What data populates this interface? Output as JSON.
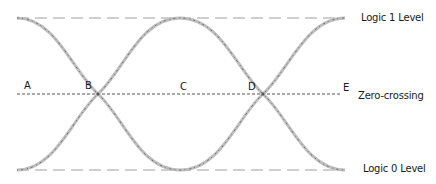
{
  "diagram": {
    "type": "eye-diagram",
    "levels": {
      "logic1": {
        "label": "Logic 1 Level"
      },
      "logic0": {
        "label": "Logic 0 Level"
      },
      "zero": {
        "label": "Zero-crossing"
      }
    },
    "points": [
      {
        "id": "A",
        "label": "A"
      },
      {
        "id": "B",
        "label": "B"
      },
      {
        "id": "C",
        "label": "C"
      },
      {
        "id": "D",
        "label": "D"
      },
      {
        "id": "E",
        "label": "E"
      }
    ],
    "colors": {
      "trace": "#9a9a9a",
      "trace_dark": "#6e6e6e",
      "level_line": "#9c9c9c",
      "zero_line": "#555555",
      "text": "#1a1a1a"
    }
  }
}
